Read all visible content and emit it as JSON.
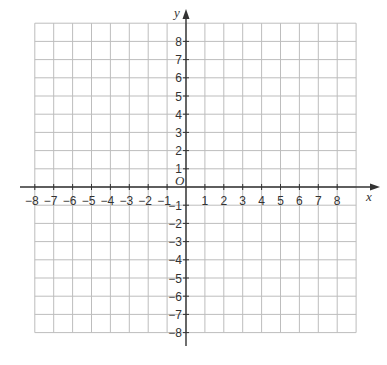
{
  "chart_data": {
    "type": "scatter",
    "title": "",
    "xlabel": "x",
    "ylabel": "y",
    "origin_label": "O",
    "xlim": [
      -8,
      8
    ],
    "ylim": [
      -8,
      8
    ],
    "grid": true,
    "grid_extent": {
      "x": [
        -8,
        9
      ],
      "y": [
        -8,
        9
      ]
    },
    "x_ticks": [
      -8,
      -7,
      -6,
      -5,
      -4,
      -3,
      -2,
      -1,
      1,
      2,
      3,
      4,
      5,
      6,
      7,
      8
    ],
    "y_ticks": [
      -8,
      -7,
      -6,
      -5,
      -4,
      -3,
      -2,
      -1,
      1,
      2,
      3,
      4,
      5,
      6,
      7,
      8
    ],
    "series": [],
    "legend": null
  },
  "colors": {
    "grid": "#bdbdbd",
    "axis": "#333333",
    "text": "#333333"
  }
}
